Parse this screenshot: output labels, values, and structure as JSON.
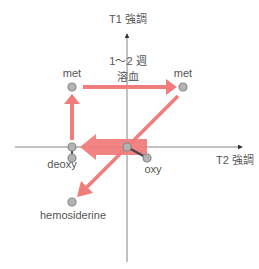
{
  "axes": {
    "y_label": "T1 強調",
    "x_label": "T2 強調"
  },
  "annotation": {
    "line1": "1～2 週",
    "line2": "溶血"
  },
  "nodes": {
    "met_left": "met",
    "met_right": "met",
    "deoxy": "deoxy",
    "oxy": "oxy",
    "hemosiderine": "hemosiderine"
  },
  "colors": {
    "arrow": "#f07c7c",
    "axis": "#666666",
    "dot_fill": "#b3b3b3",
    "dot_stroke": "#8a8a8a",
    "connector": "#555555"
  }
}
